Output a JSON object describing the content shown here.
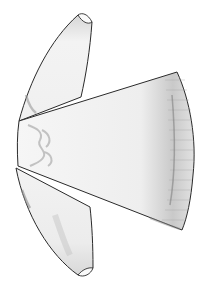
{
  "image": {
    "subject": "Line drawing of a tunic / dalmatic garment with two sleeves, rotated sideways",
    "colors": {
      "background": "#ffffff",
      "outline": "#2a2a2a",
      "fill": "#f4f4f4",
      "shade": "#b8b8b8",
      "dark_shade": "#8a8a8a"
    }
  }
}
